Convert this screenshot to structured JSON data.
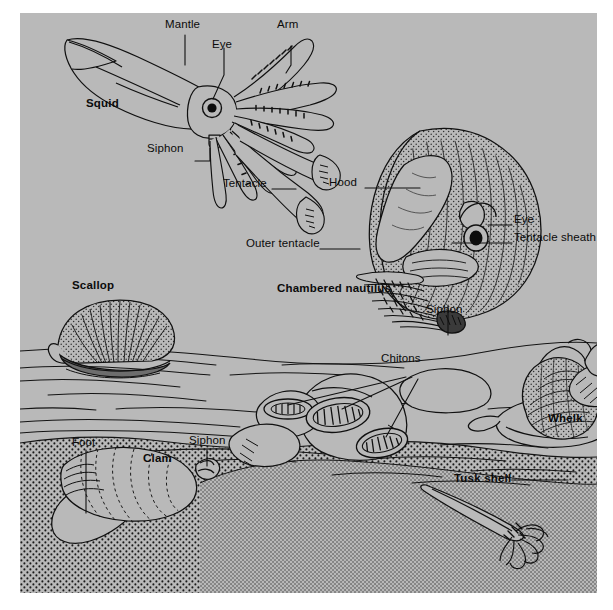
{
  "plate": {
    "title": "Mollusk anatomy and habitat plate",
    "background_color": "#b9b9b9",
    "page_color": "#ffffff",
    "ink_color": "#101010",
    "sand_color": "#b9b9b9"
  },
  "organisms": [
    {
      "id": "squid",
      "name": "Squid",
      "bold": true
    },
    {
      "id": "chambered-nautilus",
      "name": "Chambered nautilus",
      "bold": true
    },
    {
      "id": "scallop",
      "name": "Scallop",
      "bold": true
    },
    {
      "id": "clam",
      "name": "Clam",
      "bold": true
    },
    {
      "id": "chitons",
      "name": "Chitons",
      "bold": false
    },
    {
      "id": "whelk",
      "name": "Whelk",
      "bold": true
    },
    {
      "id": "tusk-shell",
      "name": "Tusk shell",
      "bold": true
    }
  ],
  "labels": {
    "squid_mantle": "Mantle",
    "squid_eye": "Eye",
    "squid_arm": "Arm",
    "squid_name": "Squid",
    "squid_siphon": "Siphon",
    "squid_tentacle": "Tentacle",
    "nautilus_hood": "Hood",
    "nautilus_eye": "Eye",
    "nautilus_tentacle_sheath": "Tentacle sheath",
    "nautilus_outer_tentacle": "Outer tentacle",
    "nautilus_name": "Chambered nautilus",
    "nautilus_siphon": "Siphon",
    "scallop_name": "Scallop",
    "clam_foot": "Foot",
    "clam_siphon": "Siphon",
    "clam_name": "Clam",
    "chitons_name": "Chitons",
    "whelk_name": "Whelk",
    "tusk_shell_name": "Tusk shell"
  }
}
